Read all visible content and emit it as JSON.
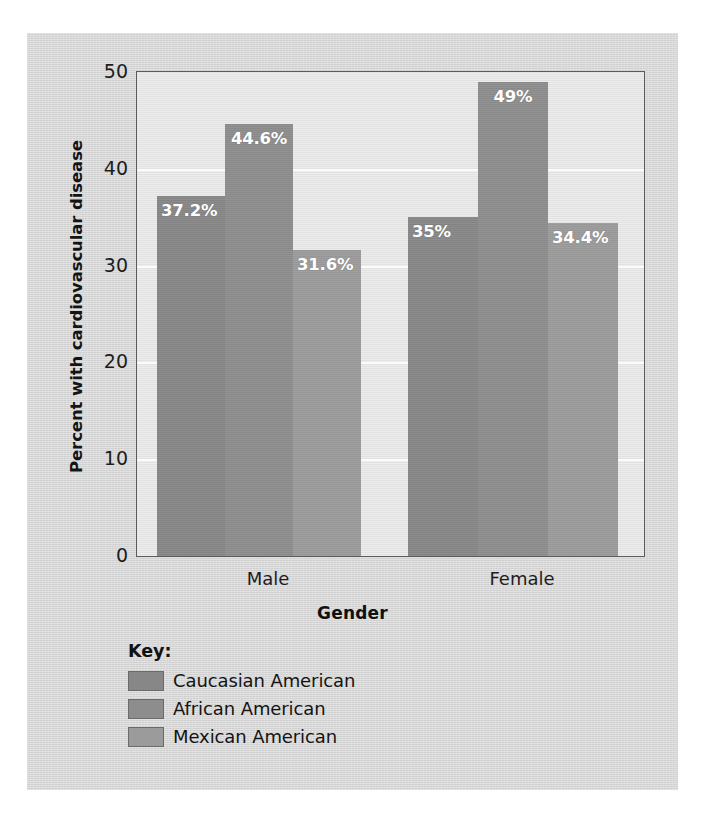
{
  "chart_data": {
    "type": "bar",
    "title": "",
    "xlabel": "Gender",
    "ylabel": "Percent with cardiovascular disease",
    "categories": [
      "Male",
      "Female"
    ],
    "ylim": [
      0,
      50
    ],
    "yticks": [
      0,
      10,
      20,
      30,
      40,
      50
    ],
    "ytick_labels": [
      "0",
      "10",
      "20",
      "30",
      "40",
      "50"
    ],
    "grid": "horizontal-white",
    "legend_position": "below-plot-left",
    "legend_title": "Key:",
    "series": [
      {
        "name": "Caucasian American",
        "color": "#878787",
        "values": [
          37.2,
          35
        ],
        "labels": [
          "37.2%",
          "35%"
        ]
      },
      {
        "name": "African American",
        "color": "#8d8d8d",
        "values": [
          44.6,
          49
        ],
        "labels": [
          "44.6%",
          "49%"
        ]
      },
      {
        "name": "Mexican American",
        "color": "#9b9b9b",
        "values": [
          31.6,
          34.4
        ],
        "labels": [
          "31.6%",
          "34.4%"
        ]
      }
    ]
  },
  "colors": {
    "page_background": "#ffffff",
    "panel_background": "#d4d4d4",
    "plot_background": "#e4e4e4",
    "plot_frame": "#5a5a5a",
    "gridline": "#fbfbfb",
    "bar_label_text": "#ffffff",
    "axis_text": "#1d1d1d"
  }
}
